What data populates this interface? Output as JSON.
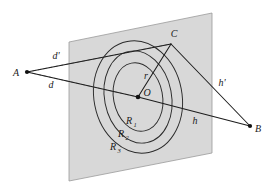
{
  "figure": {
    "background_color": "#ffffff",
    "plane": {
      "name": "obstruction-plane",
      "fill_color": "#d8d8d8",
      "edge_color": "#9a9a9a",
      "corners": [
        [
          69,
          42
        ],
        [
          212,
          13
        ],
        [
          212,
          153
        ],
        [
          69,
          181
        ]
      ]
    },
    "points": {
      "A": {
        "label": "A",
        "x": 27,
        "y": 72,
        "label_x": 19,
        "label_y": 76
      },
      "B": {
        "label": "B",
        "x": 250,
        "y": 126,
        "label_x": 256,
        "label_y": 132
      },
      "C": {
        "label": "C",
        "x": 171,
        "y": 44,
        "label_x": 173,
        "label_y": 38
      },
      "O": {
        "label": "O",
        "x": 138,
        "y": 97,
        "label_x": 145,
        "label_y": 96
      }
    },
    "segments": [
      {
        "name": "segment-A-C",
        "label": "d'",
        "from": "A",
        "to": "C",
        "style": "solid",
        "label_x": 56,
        "label_y": 57
      },
      {
        "name": "segment-A-O",
        "label": "d",
        "from": "A",
        "to": "O",
        "style": "solid",
        "label_x": 51,
        "label_y": 86
      },
      {
        "name": "segment-C-B",
        "label": "h'",
        "from": "C",
        "to": "B",
        "style": "solid",
        "label_x": 222,
        "label_y": 84
      },
      {
        "name": "segment-O-B",
        "label": "h",
        "from": "O",
        "to": "B",
        "style": "solid",
        "label_x": 194,
        "label_y": 122
      },
      {
        "name": "segment-O-C",
        "label": "r",
        "from": "O",
        "to": "C",
        "style": "solid",
        "label_x": 146,
        "label_y": 77
      }
    ],
    "dashed_segments": [
      {
        "name": "dashed-A-C-projection",
        "from_x": 27,
        "to_x": 171,
        "from_y": 72,
        "to_y": 44
      },
      {
        "name": "dashed-A-O-projection",
        "from_x": 27,
        "to_x": 138,
        "from_y": 72,
        "to_y": 97
      }
    ],
    "zones": [
      {
        "name": "zone-R1",
        "label": "R",
        "subscript": "1",
        "label_x": 129,
        "label_y": 122,
        "rx": 24.5,
        "ry": 34.5
      },
      {
        "name": "zone-R2",
        "label": "R",
        "subscript": "2",
        "label_x": 121,
        "label_y": 135,
        "rx": 33.5,
        "ry": 46.5
      },
      {
        "name": "zone-R3",
        "label": "R",
        "subscript": "3",
        "label_x": 113,
        "label_y": 148,
        "rx": 44.0,
        "ry": 56.5
      }
    ],
    "ellipse_center": {
      "cx": 138,
      "cy": 97
    },
    "ellipse_rotation_deg": -11,
    "colors": {
      "plane_fill": "#d8d8d8",
      "line": "#1c1c1c",
      "dashed": "#8a8a8a",
      "ring": "#2a2a2a",
      "text": "#1a1a1a"
    }
  },
  "chart_data": {
    "type": "diagram",
    "nodes": [
      "A",
      "B",
      "C",
      "O"
    ],
    "edges": [
      {
        "from": "A",
        "to": "C",
        "label": "d'"
      },
      {
        "from": "A",
        "to": "O",
        "label": "d"
      },
      {
        "from": "C",
        "to": "B",
        "label": "h'"
      },
      {
        "from": "O",
        "to": "B",
        "label": "h"
      },
      {
        "from": "O",
        "to": "C",
        "label": "r"
      }
    ],
    "zone_labels": [
      "R1",
      "R2",
      "R3"
    ]
  }
}
